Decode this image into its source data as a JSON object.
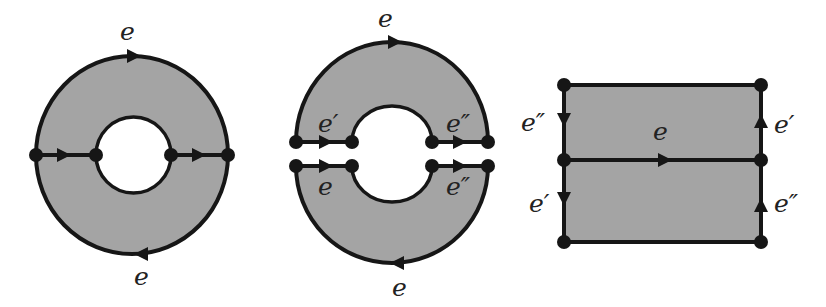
{
  "diagram": {
    "colors": {
      "fill": "#a4a4a4",
      "stroke": "#161616",
      "background": "#ffffff"
    },
    "figures": [
      {
        "name": "annulus",
        "labels": {
          "top": "e",
          "bottom": "e"
        }
      },
      {
        "name": "cut-annulus",
        "labels": {
          "top": "e",
          "upper_left": "e′",
          "upper_right": "e″",
          "lower_left": "e",
          "lower_right": "e″",
          "bottom": "e"
        }
      },
      {
        "name": "rectangle",
        "labels": {
          "left_upper": "e″",
          "left_lower": "e′",
          "middle": "e",
          "right_upper": "e′",
          "right_lower": "e″"
        }
      }
    ]
  }
}
